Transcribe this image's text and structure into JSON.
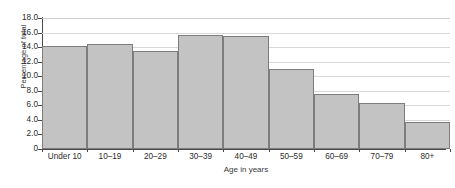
{
  "chart_data": {
    "type": "bar",
    "title": "",
    "subtitle": "",
    "xlabel": "Age in years",
    "ylabel": "Percentage of total",
    "categories": [
      "Under 10",
      "10–19",
      "20–29",
      "30–39",
      "40–49",
      "50–59",
      "60–69",
      "70–79",
      "80+"
    ],
    "values": [
      14.2,
      14.4,
      13.5,
      15.7,
      15.5,
      11.0,
      7.6,
      6.3,
      3.7
    ],
    "ylim": [
      0,
      18.0
    ],
    "ytick_labels": [
      "0",
      "2.0",
      "4.0",
      "6.0",
      "8.0",
      "10.0",
      "12.0",
      "14.0",
      "16.0",
      "18.0"
    ],
    "ytick_values": [
      0,
      2.0,
      4.0,
      6.0,
      8.0,
      10.0,
      12.0,
      14.0,
      16.0,
      18.0
    ],
    "grid": "horizontal",
    "legend": "none",
    "annotations": [],
    "colors": {
      "bar_fill": "#c3c3c3",
      "bar_border": "#7d7d7d",
      "gridline": "#d8d8d8",
      "axis": "#4a4a4a",
      "text": "#2b2b2b",
      "background": "#ffffff"
    }
  }
}
